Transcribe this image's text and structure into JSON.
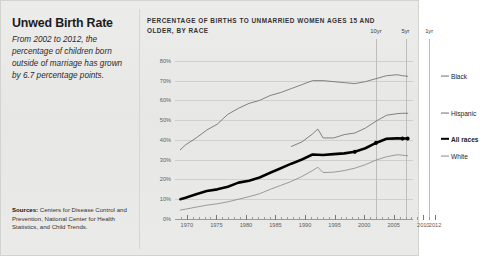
{
  "headline": "Unwed Birth Rate",
  "dek": "From 2002 to 2012, the percentage of children born outside of marriage has grown by 6.7 percentage points.",
  "sources_label": "Sources:",
  "sources_text": " Centers for Disease Control and Prevention, National Center for Health Statistics, and Child Trends.",
  "chart_data": {
    "type": "line",
    "title": "PERCENTAGE OF BIRTHS TO UNMARRIED WOMEN AGES 15 AND OLDER, BY RACE",
    "xlabel": "",
    "ylabel": "",
    "xlim": [
      1968,
      2013
    ],
    "ylim": [
      0,
      85
    ],
    "grid": true,
    "legend_position": "right-inline",
    "ytick_labels": [
      "0%",
      "10%",
      "20%",
      "30%",
      "40%",
      "50%",
      "60%",
      "70%",
      "80%"
    ],
    "ytick_values": [
      0,
      10,
      20,
      30,
      40,
      50,
      60,
      70,
      80
    ],
    "xtick_labels": [
      "1970",
      "1975",
      "1980",
      "1985",
      "1990",
      "1995",
      "2000",
      "2005",
      "2010",
      "2012"
    ],
    "xtick_values": [
      1970,
      1975,
      1980,
      1985,
      1990,
      1995,
      2000,
      2005,
      2010,
      2012
    ],
    "annotations": [
      {
        "label": "10yr",
        "x": 2002
      },
      {
        "label": "5yr",
        "x": 2007
      },
      {
        "label": "1yr",
        "x": 2011
      }
    ],
    "series": [
      {
        "name": "Black",
        "label": "Black",
        "color": "#6f6f6f",
        "emphasis": false,
        "x": [
          1969,
          1970,
          1972,
          1974,
          1976,
          1978,
          1980,
          1982,
          1984,
          1986,
          1988,
          1990,
          1992,
          1994,
          1996,
          1998,
          2000,
          2002,
          2004,
          2006,
          2008,
          2010,
          2011,
          2012
        ],
        "values": [
          35.0,
          37.5,
          41.0,
          45.0,
          48.0,
          53.0,
          56.0,
          58.5,
          60.0,
          62.5,
          64.0,
          66.0,
          68.0,
          70.0,
          70.0,
          69.5,
          69.0,
          68.5,
          69.5,
          71.0,
          72.5,
          73.0,
          72.5,
          72.2
        ]
      },
      {
        "name": "Hispanic",
        "label": "Hispanic",
        "color": "#6f6f6f",
        "emphasis": false,
        "x": [
          1990,
          1992,
          1994,
          1995,
          1996,
          1998,
          2000,
          2002,
          2004,
          2006,
          2008,
          2010,
          2011,
          2012
        ],
        "values": [
          36.7,
          39.0,
          43.0,
          45.5,
          41.0,
          41.0,
          42.7,
          43.5,
          46.0,
          49.5,
          52.5,
          53.3,
          53.5,
          53.5
        ]
      },
      {
        "name": "All races",
        "label": "All races",
        "color": "#000000",
        "emphasis": true,
        "x": [
          1969,
          1970,
          1972,
          1974,
          1976,
          1978,
          1980,
          1982,
          1984,
          1986,
          1988,
          1990,
          1992,
          1994,
          1996,
          1998,
          2000,
          2002,
          2004,
          2006,
          2008,
          2010,
          2011,
          2012
        ],
        "values": [
          10.0,
          10.7,
          12.5,
          14.2,
          15.0,
          16.3,
          18.4,
          19.4,
          21.0,
          23.4,
          25.7,
          28.0,
          30.1,
          32.6,
          32.4,
          32.8,
          33.2,
          34.0,
          35.8,
          38.5,
          40.6,
          40.8,
          40.7,
          40.7
        ]
      },
      {
        "name": "White",
        "label": "White",
        "color": "#8c8c8c",
        "emphasis": false,
        "x": [
          1969,
          1970,
          1972,
          1974,
          1976,
          1978,
          1980,
          1982,
          1984,
          1986,
          1988,
          1990,
          1992,
          1994,
          1995,
          1996,
          1998,
          2000,
          2002,
          2004,
          2006,
          2008,
          2010,
          2011,
          2012
        ],
        "values": [
          4.5,
          5.0,
          6.0,
          7.0,
          7.7,
          8.7,
          10.0,
          11.3,
          12.8,
          15.0,
          17.0,
          19.0,
          21.5,
          24.5,
          26.2,
          23.5,
          23.7,
          24.5,
          25.7,
          27.5,
          29.8,
          31.5,
          32.5,
          32.3,
          32.0
        ]
      }
    ]
  }
}
